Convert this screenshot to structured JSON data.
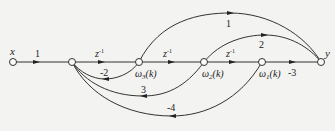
{
  "diagram": {
    "type": "signal-flow-graph",
    "nodes": [
      {
        "id": "x",
        "label": "x"
      },
      {
        "id": "a",
        "label": ""
      },
      {
        "id": "w3",
        "label": "ω",
        "sub": "3",
        "suffix": "(k)"
      },
      {
        "id": "w2",
        "label": "ω",
        "sub": "2",
        "suffix": "(k)"
      },
      {
        "id": "w1",
        "label": "ω",
        "sub": "1",
        "suffix": "(k)"
      },
      {
        "id": "y",
        "label": "y"
      }
    ],
    "edges": [
      {
        "from": "x",
        "to": "a",
        "gain": "1"
      },
      {
        "from": "a",
        "to": "w3",
        "gain": "z",
        "sup": "-1"
      },
      {
        "from": "w3",
        "to": "w2",
        "gain": "z",
        "sup": "-1"
      },
      {
        "from": "w2",
        "to": "w1",
        "gain": "z",
        "sup": "-1"
      },
      {
        "from": "w1",
        "to": "y",
        "gain": "-3"
      },
      {
        "from": "w3",
        "to": "y",
        "gain": "1"
      },
      {
        "from": "w2",
        "to": "y",
        "gain": "2"
      },
      {
        "from": "w3",
        "to": "a",
        "gain": "-2"
      },
      {
        "from": "w2",
        "to": "a",
        "gain": "3"
      },
      {
        "from": "w1",
        "to": "a",
        "gain": "-4"
      }
    ]
  }
}
